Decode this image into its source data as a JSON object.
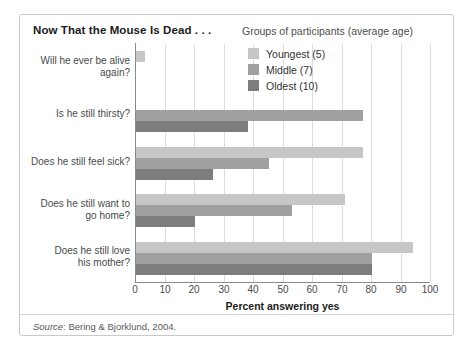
{
  "figure": {
    "title": "Now That the Mouse Is Dead . . .",
    "legend_title": "Groups of participants (average age)",
    "source_word": "Source",
    "source_rest": ": Bering & Bjorklund, 2004."
  },
  "colors": {
    "youngest": "#c6c6c6",
    "middle": "#a0a0a0",
    "oldest": "#7d7d7d",
    "gridline": "#dcdcdc",
    "axis": "#8a8a8a",
    "border": "#c9c9c9",
    "text": "#4a4a4a",
    "title_text": "#1b1b1b"
  },
  "chart_data": {
    "type": "bar",
    "orientation": "horizontal",
    "title": "Now That the Mouse Is Dead . . .",
    "xlabel": "Percent answering yes",
    "ylabel": "",
    "xlim": [
      0,
      100
    ],
    "xticks": [
      "0",
      "10",
      "20",
      "30",
      "40",
      "50",
      "60",
      "70",
      "80",
      "90",
      "100"
    ],
    "grid": true,
    "legend_position": "top-right",
    "legend_title": "Groups of participants (average age)",
    "categories": [
      "Will he ever be alive again?",
      "Is he still thirsty?",
      "Does he still feel sick?",
      "Does he still want to go home?",
      "Does he still love his mother?"
    ],
    "series": [
      {
        "name": "Youngest (5)",
        "color": "#c6c6c6",
        "values": [
          3,
          0,
          77,
          71,
          94
        ]
      },
      {
        "name": "Middle (7)",
        "color": "#a0a0a0",
        "values": [
          0,
          77,
          45,
          53,
          80
        ]
      },
      {
        "name": "Oldest (10)",
        "color": "#7d7d7d",
        "values": [
          0,
          38,
          26,
          20,
          80
        ]
      }
    ],
    "source": "Source: Bering & Bjorklund, 2004."
  },
  "category_lines": [
    [
      "Will he ever be alive",
      "again?"
    ],
    [
      "Is he still thirsty?"
    ],
    [
      "Does he still feel sick?"
    ],
    [
      "Does he still want to",
      "go home?"
    ],
    [
      "Does he still love",
      "his mother?"
    ]
  ]
}
